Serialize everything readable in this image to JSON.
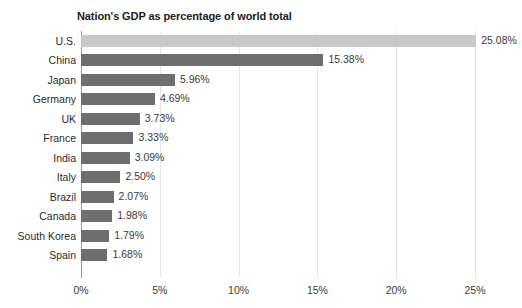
{
  "chart_data": {
    "type": "bar",
    "orientation": "horizontal",
    "title": "Nation's GDP as percentage of world total",
    "xlabel": "",
    "ylabel": "",
    "xlim": [
      0,
      25
    ],
    "grid": true,
    "legend": "none",
    "tick_labels": [
      "0%",
      "5%",
      "10%",
      "15%",
      "20%",
      "25%"
    ],
    "tick_values": [
      0,
      5,
      10,
      15,
      20,
      25
    ],
    "categories": [
      "U.S.",
      "China",
      "Japan",
      "Germany",
      "UK",
      "France",
      "India",
      "Italy",
      "Brazil",
      "Canada",
      "South Korea",
      "Spain"
    ],
    "values": [
      25.08,
      15.38,
      5.96,
      4.69,
      3.73,
      3.33,
      3.09,
      2.5,
      2.07,
      1.98,
      1.79,
      1.68
    ],
    "value_labels": [
      "25.08%",
      "15.38%",
      "5.96%",
      "4.69%",
      "3.73%",
      "3.33%",
      "3.09%",
      "2.50%",
      "2.07%",
      "1.98%",
      "1.79%",
      "1.68%"
    ],
    "bars": [
      {
        "category": "U.S.",
        "value": 25.08,
        "label": "25.08%",
        "highlight": true
      },
      {
        "category": "China",
        "value": 15.38,
        "label": "15.38%",
        "highlight": false
      },
      {
        "category": "Japan",
        "value": 5.96,
        "label": "5.96%",
        "highlight": false
      },
      {
        "category": "Germany",
        "value": 4.69,
        "label": "4.69%",
        "highlight": false
      },
      {
        "category": "UK",
        "value": 3.73,
        "label": "3.73%",
        "highlight": false
      },
      {
        "category": "France",
        "value": 3.33,
        "label": "3.33%",
        "highlight": false
      },
      {
        "category": "India",
        "value": 3.09,
        "label": "3.09%",
        "highlight": false
      },
      {
        "category": "Italy",
        "value": 2.5,
        "label": "2.50%",
        "highlight": false
      },
      {
        "category": "Brazil",
        "value": 2.07,
        "label": "2.07%",
        "highlight": false
      },
      {
        "category": "Canada",
        "value": 1.98,
        "label": "1.98%",
        "highlight": false
      },
      {
        "category": "South Korea",
        "value": 1.79,
        "label": "1.79%",
        "highlight": false
      },
      {
        "category": "Spain",
        "value": 1.68,
        "label": "1.68%",
        "highlight": false
      }
    ],
    "colors": {
      "bar": "#6e6e6e",
      "bar_highlight": "#c8c8c8",
      "gridline": "#e6e6e6",
      "axis_line": "#9a9a9a",
      "title_text": "#1c1c1c",
      "label_text": "#2b2b2b",
      "value_text": "#3a3a3a",
      "background": "#ffffff"
    }
  }
}
